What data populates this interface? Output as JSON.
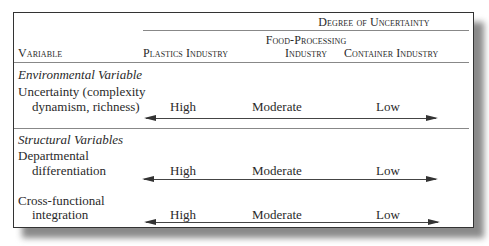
{
  "table": {
    "spanning_header": "Degree of Uncertainty",
    "columns": {
      "variable": "Variable",
      "plastics": "Plastics Industry",
      "food_line1": "Food-Processing",
      "food_line2": "Industry",
      "container": "Container Industry"
    },
    "sections": [
      {
        "title": "Environmental Variable",
        "rows": [
          {
            "label_line1": "Uncertainty (complexity",
            "label_line2": "dynamism, richness)",
            "plastics": "High",
            "food": "Moderate",
            "container": "Low"
          }
        ]
      },
      {
        "title": "Structural Variables",
        "rows": [
          {
            "label_line1": "Departmental",
            "label_line2": "differentiation",
            "plastics": "High",
            "food": "Moderate",
            "container": "Low"
          },
          {
            "label_line1": "Cross-functional",
            "label_line2": "integration",
            "plastics": "High",
            "food": "Moderate",
            "container": "Low"
          }
        ]
      }
    ]
  }
}
